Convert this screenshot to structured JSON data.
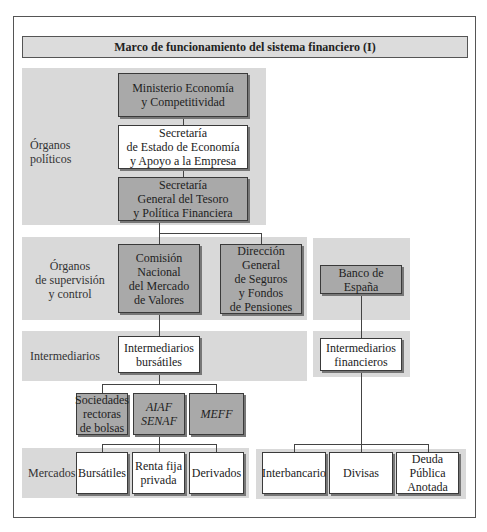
{
  "title": "Marco de funcionamiento del sistema financiero (I)",
  "rows": {
    "organos_politicos": "Órganos\npolíticos",
    "organos_supervision": "Órganos\nde supervisión\ny control",
    "intermediarios": "Intermediarios",
    "mercados": "Mercados"
  },
  "nodes": {
    "ministerio": "Ministerio Economía\ny Competitividad",
    "secretaria_estado": "Secretaría\nde Estado de Economía\ny Apoyo a la Empresa",
    "secretaria_general": "Secretaría\nGeneral del Tesoro\ny Política Financiera",
    "cnmv": "Comisión\nNacional\ndel Mercado\nde Valores",
    "dgsfp": "Dirección\nGeneral\nde Seguros\ny Fondos\nde Pensiones",
    "banco_espana": "Banco de España",
    "intermediarios_bursatiles": "Intermediarios\nbursátiles",
    "intermediarios_financieros": "Intermediarios\nfinancieros",
    "sociedades_rectoras": "Sociedades\nrectoras\nde bolsas",
    "aiaf_senaf": "AIAF\nSENAF",
    "meff": "MEFF",
    "bursatiles": "Bursátiles",
    "renta_fija": "Renta fija\nprivada",
    "derivados": "Derivados",
    "interbancario": "Interbancario",
    "divisas": "Divisas",
    "deuda_publica": "Deuda\nPública\nAnotada"
  },
  "colors": {
    "panel": "#d9d9d9",
    "dark_box": "#a9a9a9",
    "light_box": "#ffffff",
    "border": "#3a3a3a"
  }
}
